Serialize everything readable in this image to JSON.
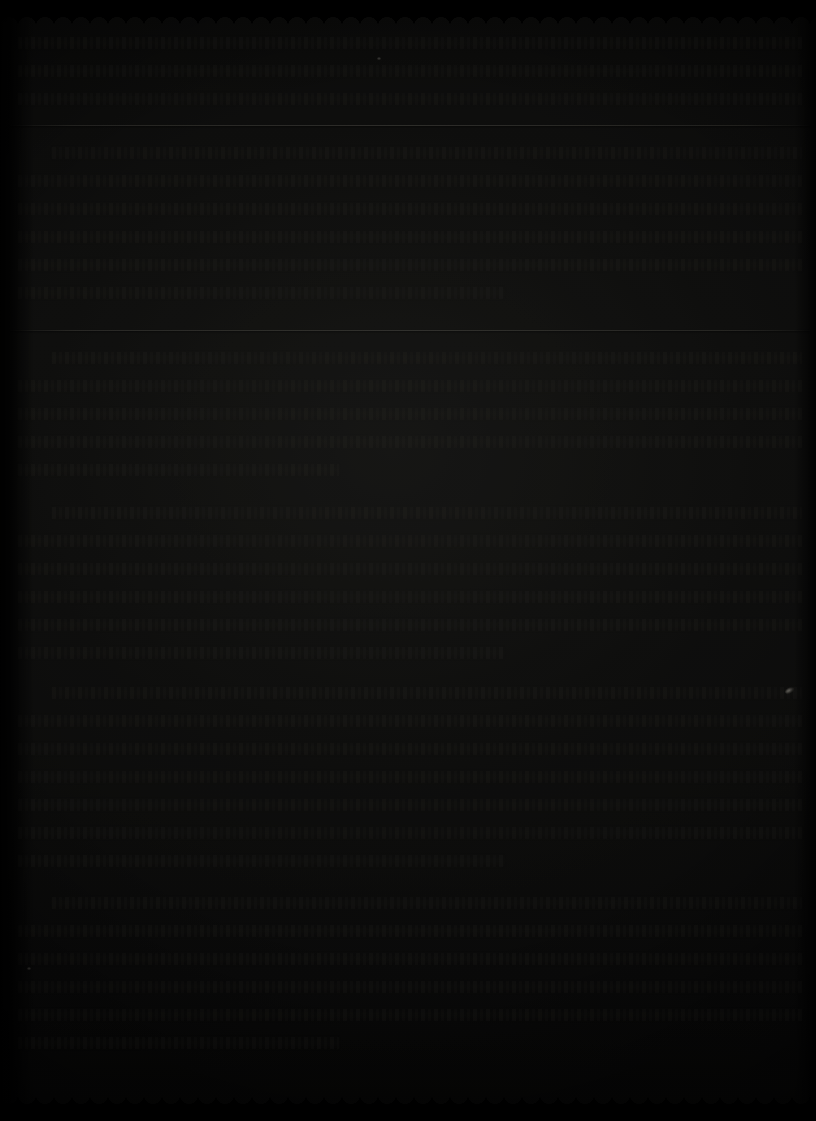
{
  "document": {
    "kind": "scanned-page",
    "legibility": "illegible",
    "orientation": "portrait",
    "width_px": 816,
    "height_px": 1121,
    "notes_visible_text": "none — no characters, numbers, captions or page folios are resolvable at any magnification",
    "appearance": {
      "overall": "severely underexposed near-black photographic scan of a printed page",
      "page_base_color": "#131312",
      "deepest_shadow_color": "#030303",
      "ink_trace_color": "#3a3832",
      "rule_line_color": "#68665e",
      "highlight_speck_color": "#d0ccc0",
      "grain": "visible film/sensor noise across the entire frame"
    },
    "edges": {
      "top": "deckled / scalloped page edge",
      "bottom": "deckled / scalloped page edge",
      "left": "dark vertical binding gutter shadow",
      "right": "soft dark falloff"
    }
  },
  "rules": [
    {
      "name": "upper-divider",
      "y": 125,
      "width_span": "full-measure"
    },
    {
      "name": "lower-divider",
      "y": 330,
      "width_span": "full-measure"
    }
  ],
  "artifacts": [
    {
      "name": "specular-speck",
      "x": 789,
      "y": 690,
      "note": "small bright highlight near right edge"
    },
    {
      "name": "dust-speck-left",
      "x": 28,
      "y": 968,
      "note": "faint light mote in left margin"
    },
    {
      "name": "dust-speck-upper",
      "x": 378,
      "y": 58,
      "note": "faint light mote near top"
    }
  ],
  "blocks": [
    {
      "name": "block-head",
      "top": 30,
      "line_height": 28,
      "lines": [
        {
          "text": "",
          "style": "full"
        },
        {
          "text": "",
          "style": "full"
        },
        {
          "text": "",
          "style": "full"
        }
      ]
    },
    {
      "name": "block-upper",
      "top": 140,
      "line_height": 28,
      "lines": [
        {
          "text": "",
          "style": "indent"
        },
        {
          "text": "",
          "style": "full"
        },
        {
          "text": "",
          "style": "full"
        },
        {
          "text": "",
          "style": "full"
        },
        {
          "text": "",
          "style": "full"
        },
        {
          "text": "",
          "style": "short"
        }
      ]
    },
    {
      "name": "block-middle",
      "top": 345,
      "line_height": 28,
      "lines": [
        {
          "text": "",
          "style": "indent"
        },
        {
          "text": "",
          "style": "full"
        },
        {
          "text": "",
          "style": "full"
        },
        {
          "text": "",
          "style": "full"
        },
        {
          "text": "",
          "style": "shorter"
        }
      ]
    },
    {
      "name": "block-lower-a",
      "top": 500,
      "line_height": 28,
      "lines": [
        {
          "text": "",
          "style": "indent"
        },
        {
          "text": "",
          "style": "full"
        },
        {
          "text": "",
          "style": "full"
        },
        {
          "text": "",
          "style": "full"
        },
        {
          "text": "",
          "style": "full"
        },
        {
          "text": "",
          "style": "short"
        }
      ]
    },
    {
      "name": "block-lower-b",
      "top": 680,
      "line_height": 28,
      "lines": [
        {
          "text": "",
          "style": "indent"
        },
        {
          "text": "",
          "style": "full"
        },
        {
          "text": "",
          "style": "full"
        },
        {
          "text": "",
          "style": "full"
        },
        {
          "text": "",
          "style": "full"
        },
        {
          "text": "",
          "style": "full"
        },
        {
          "text": "",
          "style": "short"
        }
      ]
    },
    {
      "name": "block-foot",
      "top": 890,
      "line_height": 28,
      "lines": [
        {
          "text": "",
          "style": "indent"
        },
        {
          "text": "",
          "style": "full"
        },
        {
          "text": "",
          "style": "full"
        },
        {
          "text": "",
          "style": "full"
        },
        {
          "text": "",
          "style": "full"
        },
        {
          "text": "",
          "style": "shorter"
        }
      ]
    }
  ]
}
